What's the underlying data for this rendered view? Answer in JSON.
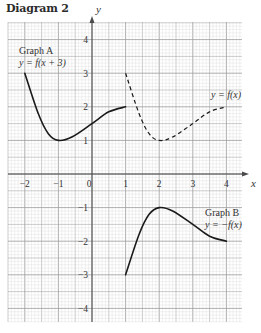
{
  "title": "Diagram 2",
  "axes": {
    "x_label": "x",
    "y_label": "y",
    "x_ticks": [
      -2,
      -1,
      0,
      1,
      2,
      3,
      4
    ],
    "y_ticks": [
      4,
      3,
      2,
      1,
      -1,
      -2,
      -3,
      -4
    ],
    "x_range": [
      -2.5,
      4.5
    ],
    "y_range": [
      -4.45,
      4.5
    ]
  },
  "graphs": [
    {
      "name": "Graph A",
      "equation": "y = f(x + 3)",
      "style": "solid",
      "points": [
        [
          -2,
          3
        ],
        [
          -1.6,
          1.8
        ],
        [
          -1.3,
          1.2
        ],
        [
          -1,
          1
        ],
        [
          -0.6,
          1.1
        ],
        [
          0,
          1.5
        ],
        [
          0.5,
          1.85
        ],
        [
          1,
          2
        ]
      ]
    },
    {
      "name": "",
      "equation": "y = f(x)",
      "style": "dashed",
      "points": [
        [
          1,
          3
        ],
        [
          1.4,
          1.8
        ],
        [
          1.7,
          1.2
        ],
        [
          2,
          1
        ],
        [
          2.4,
          1.1
        ],
        [
          3,
          1.5
        ],
        [
          3.5,
          1.85
        ],
        [
          4,
          2
        ]
      ]
    },
    {
      "name": "Graph B",
      "equation": "y = −f(x)",
      "style": "solid",
      "points": [
        [
          1,
          -3
        ],
        [
          1.4,
          -1.8
        ],
        [
          1.7,
          -1.2
        ],
        [
          2,
          -1
        ],
        [
          2.4,
          -1.1
        ],
        [
          3,
          -1.5
        ],
        [
          3.5,
          -1.85
        ],
        [
          4,
          -2
        ]
      ]
    }
  ],
  "labels": {
    "graph_a_name": "Graph A",
    "graph_a_eq": "y = f(x + 3)",
    "f_eq": "y = f(x)",
    "graph_b_name": "Graph B",
    "graph_b_eq": "y = −f(x)"
  },
  "colors": {
    "grid_minor": "#d0d0d0",
    "grid_major": "#9a9a9a",
    "axis": "#4a4a4a",
    "curve": "#1a1a1a"
  }
}
